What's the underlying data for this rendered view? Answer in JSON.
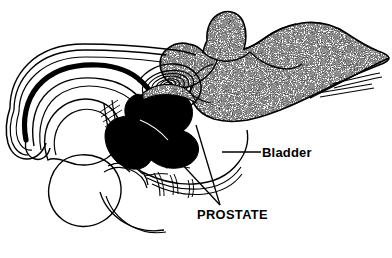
{
  "figure": {
    "background_color": "#ffffff",
    "ink_color": "#000000",
    "width": 392,
    "height": 258
  },
  "labels": {
    "bladder": {
      "text": "Bladder",
      "leader_line": "horizontal pointer from bladder outline to text"
    },
    "prostate": {
      "text": "PROSTATE",
      "leader_line": "two converging pointers from prostate mass to text"
    }
  },
  "structures": [
    {
      "name": "bladder",
      "fill": "stipple-gray",
      "description": "large stippled organ occupying upper right"
    },
    {
      "name": "prostate",
      "fill": "solid-black",
      "description": "solid black gland below and left of bladder"
    },
    {
      "name": "seminal-vesicle",
      "fill": "white-outline",
      "description": "concentric spiral coil"
    },
    {
      "name": "penis-shaft",
      "fill": "white-outline",
      "description": "long curved shaft to the left"
    },
    {
      "name": "urethra",
      "fill": "solid-black",
      "description": "thick black channel through penis"
    },
    {
      "name": "glans-penis",
      "fill": "white-outline",
      "description": "rounded tip at far left"
    },
    {
      "name": "scrotum",
      "fill": "white-outline",
      "description": "rounded sac lower left"
    },
    {
      "name": "testis",
      "fill": "white-outline",
      "description": "oval within scrotum"
    },
    {
      "name": "pubic-bone",
      "fill": "white-outline",
      "description": "bone outlines lower center"
    },
    {
      "name": "rectum",
      "fill": "white-outline",
      "description": "curved outline lower center-right"
    },
    {
      "name": "ureters",
      "fill": "line",
      "description": "thin paired lines extending to right edge"
    }
  ],
  "colors": {
    "ink": "#000000",
    "paper": "#ffffff",
    "stipple_mid": "#8a8a8a"
  }
}
